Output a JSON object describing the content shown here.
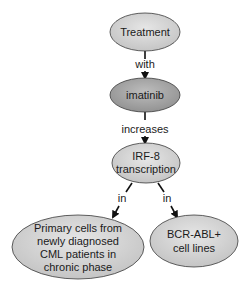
{
  "diagram": {
    "type": "concept-map",
    "colors": {
      "node_fill_light": "#d9d9d9",
      "node_fill_dark": "#a8a8a8",
      "node_stroke": "#3a3a3a",
      "edge": "#111111",
      "text": "#1a1a1a",
      "background": "#ffffff"
    },
    "nodes": [
      {
        "id": "treatment",
        "lines": [
          "Treatment"
        ],
        "shade": "light"
      },
      {
        "id": "imatinib",
        "lines": [
          "imatinib"
        ],
        "shade": "dark"
      },
      {
        "id": "irf8",
        "lines": [
          "IRF-8",
          "transcription"
        ],
        "shade": "light"
      },
      {
        "id": "primary_cells",
        "lines": [
          "Primary cells from",
          "newly diagnosed",
          "CML patients in",
          "chronic phase"
        ],
        "shade": "light"
      },
      {
        "id": "bcr_abl",
        "lines": [
          "BCR-ABL+",
          "cell lines"
        ],
        "shade": "light"
      }
    ],
    "edges": [
      {
        "from": "treatment",
        "to": "imatinib",
        "label": "with"
      },
      {
        "from": "imatinib",
        "to": "irf8",
        "label": "increases"
      },
      {
        "from": "irf8",
        "to": "primary_cells",
        "label": "in"
      },
      {
        "from": "irf8",
        "to": "bcr_abl",
        "label": "in"
      }
    ]
  }
}
